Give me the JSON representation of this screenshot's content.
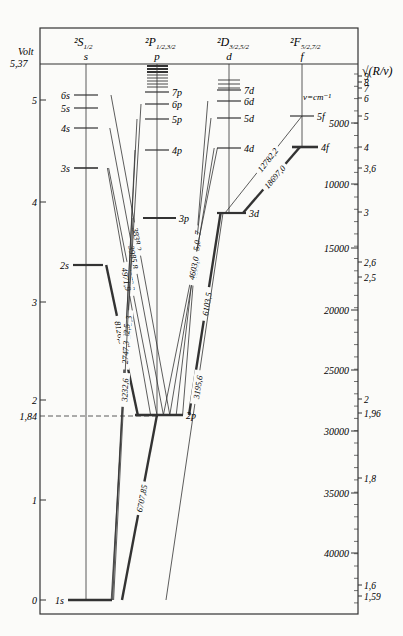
{
  "columns": [
    {
      "id": "s",
      "term": "²S",
      "sub": "1/2",
      "letter": "s",
      "x": 86
    },
    {
      "id": "p",
      "term": "²P",
      "sub": "1/2,3/2",
      "letter": "p",
      "x": 157
    },
    {
      "id": "d",
      "term": "²D",
      "sub": "3/2,5/2",
      "letter": "d",
      "x": 229
    },
    {
      "id": "f",
      "term": "²F",
      "sub": "5/2,7/2",
      "letter": "f",
      "x": 302
    }
  ],
  "left_axis": {
    "title": "Volt",
    "top_label": "5,37",
    "ticks": [
      {
        "label": "5",
        "y": 100
      },
      {
        "label": "4",
        "y": 202
      },
      {
        "label": "3",
        "y": 302
      },
      {
        "label": "2",
        "y": 400
      },
      {
        "label": "1,84",
        "y": 416,
        "dashed": true
      },
      {
        "label": "1",
        "y": 500
      },
      {
        "label": "0",
        "y": 600
      }
    ]
  },
  "right_axis": {
    "title": "√(R/ν)",
    "unit_label": "ν=cm⁻¹",
    "wavenumber_ticks": [
      {
        "label": "5000",
        "y": 123
      },
      {
        "label": "10000",
        "y": 184
      },
      {
        "label": "15000",
        "y": 248
      },
      {
        "label": "20000",
        "y": 310
      },
      {
        "label": "25000",
        "y": 370
      },
      {
        "label": "30000",
        "y": 431
      },
      {
        "label": "35000",
        "y": 493
      },
      {
        "label": "40000",
        "y": 553
      }
    ],
    "sqrt_ticks": [
      {
        "label": "9",
        "y": 76
      },
      {
        "label": "8",
        "y": 82
      },
      {
        "label": "7",
        "y": 88
      },
      {
        "label": "6",
        "y": 98
      },
      {
        "label": "5",
        "y": 116
      },
      {
        "label": "4",
        "y": 147
      },
      {
        "label": "3,6",
        "y": 168
      },
      {
        "label": "3",
        "y": 212
      },
      {
        "label": "2,6",
        "y": 262
      },
      {
        "label": "2,5",
        "y": 277
      },
      {
        "label": "2",
        "y": 399
      },
      {
        "label": "1,96",
        "y": 413
      },
      {
        "label": "1,8",
        "y": 478
      },
      {
        "label": "1,6",
        "y": 585
      },
      {
        "label": "1,59",
        "y": 596
      }
    ]
  },
  "levels": [
    {
      "name": "6s",
      "col": "s",
      "y": 95
    },
    {
      "name": "5s",
      "col": "s",
      "y": 108
    },
    {
      "name": "4s",
      "col": "s",
      "y": 128
    },
    {
      "name": "3s",
      "col": "s",
      "y": 168
    },
    {
      "name": "2s",
      "col": "s",
      "y": 265
    },
    {
      "name": "1s",
      "col": "s",
      "y": 600
    },
    {
      "name": "7p",
      "col": "p",
      "y": 92
    },
    {
      "name": "6p",
      "col": "p",
      "y": 104
    },
    {
      "name": "5p",
      "col": "p",
      "y": 119
    },
    {
      "name": "4p",
      "col": "p",
      "y": 150
    },
    {
      "name": "3p",
      "col": "p",
      "y": 218
    },
    {
      "name": "2p",
      "col": "p",
      "y": 415
    },
    {
      "name": "7d",
      "col": "d",
      "y": 90
    },
    {
      "name": "6d",
      "col": "d",
      "y": 101
    },
    {
      "name": "5d",
      "col": "d",
      "y": 118
    },
    {
      "name": "4d",
      "col": "d",
      "y": 148
    },
    {
      "name": "3d",
      "col": "d",
      "y": 213
    },
    {
      "name": "5f",
      "col": "f",
      "y": 116
    },
    {
      "name": "4f",
      "col": "f",
      "y": 147
    }
  ],
  "transitions": [
    {
      "label": "3838,2",
      "from": "6s",
      "to": "2p",
      "unit": "Å"
    },
    {
      "label": "3985,8",
      "from": "4s",
      "to": "2p",
      "unit": "Å"
    },
    {
      "label": "4273,3",
      "from": "3s",
      "to": "2p",
      "unit": "Å"
    },
    {
      "label": "4971,9",
      "from": "3s",
      "to": "2p",
      "unit": "Å"
    },
    {
      "label": "8126,5",
      "from": "2s",
      "to": "2p",
      "unit": "Å"
    },
    {
      "label": "3794,7",
      "from": "6d",
      "to": "2p",
      "unit": "Å"
    },
    {
      "label": "3915,0",
      "from": "5d",
      "to": "2p",
      "unit": "Å"
    },
    {
      "label": "4132,3",
      "from": "4d",
      "to": "2p",
      "unit": "Å"
    },
    {
      "label": "4603,0",
      "from": "4d",
      "to": "2p",
      "unit": "Å"
    },
    {
      "label": "6103,5",
      "from": "3d",
      "to": "2p",
      "unit": "Å"
    },
    {
      "label": "12782,2",
      "from": "5f",
      "to": "3d",
      "unit": "Å"
    },
    {
      "label": "18697,0",
      "from": "4f",
      "to": "3d",
      "unit": "Å"
    },
    {
      "label": "2475,3",
      "from": "6p",
      "to": "1s",
      "unit": "Å"
    },
    {
      "label": "2562,5",
      "from": "5p",
      "to": "1s",
      "unit": "Å"
    },
    {
      "label": "2747,3",
      "from": "4p",
      "to": "1s",
      "unit": "Å"
    },
    {
      "label": "3232,6",
      "from": "3p",
      "to": "1s",
      "unit": "Å"
    },
    {
      "label": "6707,85",
      "from": "2p",
      "to": "1s",
      "unit": "Å"
    },
    {
      "label": "3195,6",
      "from": "3d",
      "to": "1s",
      "unit": "Å"
    }
  ]
}
